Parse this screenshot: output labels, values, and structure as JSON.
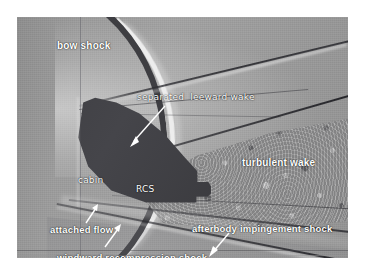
{
  "figure": {
    "type": "schlieren-flow-visualization-photograph",
    "plate": {
      "x": 17,
      "y": 17,
      "width": 331,
      "height": 241,
      "background_color": "#9a9a9a",
      "border_color": "#ffffff"
    }
  },
  "annotations": {
    "bow_shock": {
      "label": "bow shock",
      "has_arrow": false
    },
    "separated_leeward_wake": {
      "label": "separated  leeward wake",
      "has_arrow": true,
      "arrow_direction": "down-left"
    },
    "turbulent_wake": {
      "label": "turbulent wake",
      "has_arrow": false
    },
    "cabin": {
      "label": "cabin",
      "has_arrow": false
    },
    "rcs": {
      "label": "RCS",
      "has_arrow": false
    },
    "attached_flow": {
      "label": "attached flow",
      "has_arrow": true,
      "arrow_direction": "up-right"
    },
    "afterbody_impingement_shock": {
      "label": "afterbody impingement shock",
      "has_arrow": true,
      "arrow_direction": "down-left"
    },
    "windward_recompression_shock": {
      "label": "windward recompression shock",
      "has_arrow": true,
      "arrow_direction": "up-right"
    }
  },
  "colors": {
    "label_text": "#ffffff",
    "vehicle_silhouette": "#3c3c40",
    "shock_dark": "#3e3e42",
    "shock_bright": "#ededed",
    "freestream_gray": "#9a9a9a"
  }
}
